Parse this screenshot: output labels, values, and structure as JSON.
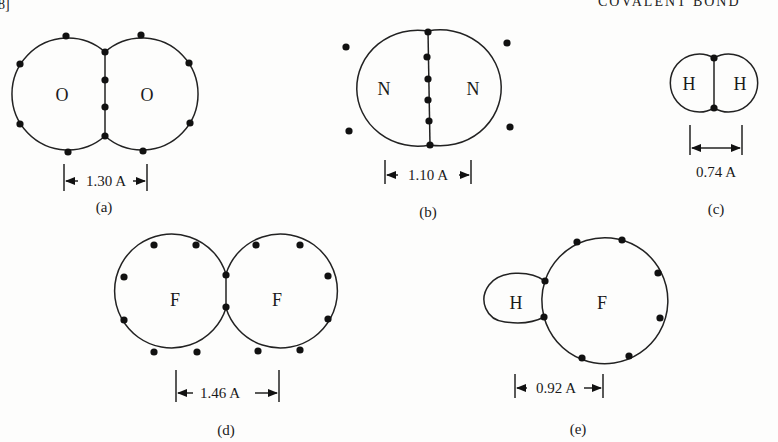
{
  "header": {
    "left_text": "8]",
    "right_text": "COVALENT BOND"
  },
  "figures": [
    {
      "id": "a",
      "caption": "(a)",
      "molecule": "O2",
      "atoms": [
        "O",
        "O"
      ],
      "shared_electrons": 4,
      "bond_length_label": "1.30 A"
    },
    {
      "id": "b",
      "caption": "(b)",
      "molecule": "N2",
      "atoms": [
        "N",
        "N"
      ],
      "shared_electrons": 6,
      "bond_length_label": "1.10 A"
    },
    {
      "id": "c",
      "caption": "(c)",
      "molecule": "H2",
      "atoms": [
        "H",
        "H"
      ],
      "shared_electrons": 2,
      "bond_length_label": "0.74 A"
    },
    {
      "id": "d",
      "caption": "(d)",
      "molecule": "F2",
      "atoms": [
        "F",
        "F"
      ],
      "shared_electrons": 2,
      "bond_length_label": "1.46 A"
    },
    {
      "id": "e",
      "caption": "(e)",
      "molecule": "HF",
      "atoms": [
        "H",
        "F"
      ],
      "shared_electrons": 2,
      "bond_length_label": "0.92 A"
    }
  ],
  "colors": {
    "ink": "#1a1a1a",
    "paper": "#fdfdfc"
  }
}
